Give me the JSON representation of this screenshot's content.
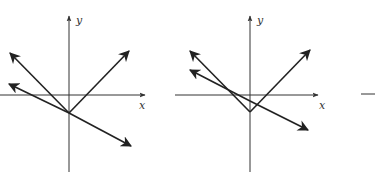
{
  "figure": {
    "colors": {
      "ink": "#222222",
      "axis": "#333333",
      "background": "#ffffff"
    },
    "panels": [
      {
        "id": "panel-1",
        "x_label": "x",
        "y_label": "y",
        "vertex": [
          69,
          113
        ],
        "lines": [
          {
            "name": "ray-upper-left",
            "from": [
              69,
              113
            ],
            "to": [
              10,
              53
            ]
          },
          {
            "name": "ray-upper-right",
            "from": [
              69,
              113
            ],
            "to": [
              129,
              51
            ]
          },
          {
            "name": "line-descending",
            "from": [
              9,
              84
            ],
            "to": [
              131,
              146
            ]
          }
        ]
      },
      {
        "id": "panel-2",
        "x_label": "x",
        "y_label": "y",
        "vertex": [
          250,
          112
        ],
        "lines": [
          {
            "name": "ray-upper-left",
            "from": [
              250,
              112
            ],
            "to": [
              190,
              51
            ]
          },
          {
            "name": "ray-upper-right",
            "from": [
              250,
              112
            ],
            "to": [
              310,
              50
            ]
          },
          {
            "name": "line-descending",
            "from": [
              190,
              70
            ],
            "to": [
              308,
              130
            ]
          }
        ]
      },
      {
        "id": "panel-3-partial",
        "x_label": "",
        "y_label": ""
      }
    ]
  }
}
